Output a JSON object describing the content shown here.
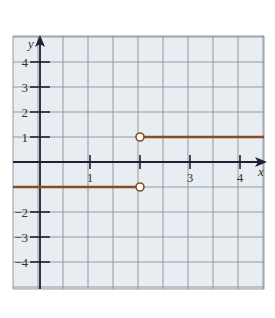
{
  "chart_data": {
    "type": "line",
    "title": "",
    "xlabel": "x",
    "ylabel": "y",
    "xlim": [
      -0.54,
      4.48
    ],
    "ylim": [
      -5.1,
      5.05
    ],
    "grid": true,
    "x_grid_step": 0.5,
    "y_grid_step": 1,
    "x_tick_labels": [
      {
        "value": 1,
        "label": "1"
      },
      {
        "value": 2,
        "label": ""
      },
      {
        "value": 3,
        "label": "3"
      },
      {
        "value": 4,
        "label": "4"
      }
    ],
    "y_tick_labels": [
      {
        "value": 4,
        "label": "4"
      },
      {
        "value": 3,
        "label": "3"
      },
      {
        "value": 2,
        "label": "2"
      },
      {
        "value": 1,
        "label": "1"
      },
      {
        "value": -2,
        "label": "−2"
      },
      {
        "value": -3,
        "label": "−3"
      },
      {
        "value": -4,
        "label": "−4"
      }
    ],
    "series": [
      {
        "name": "piece-left",
        "x": [
          -0.54,
          2
        ],
        "y": [
          -1,
          -1
        ],
        "end_open": true
      },
      {
        "name": "piece-right",
        "x": [
          2,
          4.48
        ],
        "y": [
          1,
          1
        ],
        "start_open": true
      }
    ],
    "open_points": [
      {
        "x": 2,
        "y": 1
      },
      {
        "x": 2,
        "y": -1
      }
    ],
    "colors": {
      "background": "#e8edf2",
      "grid": "#8a9099",
      "axis": "#1c2233",
      "line": "#8b4a24",
      "point_fill": "#ffffff"
    }
  }
}
